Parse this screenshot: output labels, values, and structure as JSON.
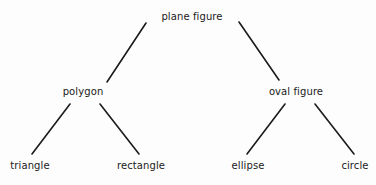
{
  "diagram": {
    "type": "tree",
    "colors": {
      "background": "#fdfdfd",
      "line": "#1a1a1a",
      "text": "#1a1a1a"
    },
    "nodes": {
      "root": {
        "label": "plane figure",
        "x": 192,
        "y": 17
      },
      "polygon": {
        "label": "polygon",
        "x": 83,
        "y": 92
      },
      "oval": {
        "label": "oval figure",
        "x": 296,
        "y": 92
      },
      "triangle": {
        "label": "triangle",
        "x": 30,
        "y": 166
      },
      "rectangle": {
        "label": "rectangle",
        "x": 141,
        "y": 166
      },
      "ellipse": {
        "label": "ellipse",
        "x": 248,
        "y": 166
      },
      "circle": {
        "label": "circle",
        "x": 355,
        "y": 166
      }
    },
    "edges": [
      {
        "from": "plane figure",
        "to": "polygon"
      },
      {
        "from": "plane figure",
        "to": "oval figure"
      },
      {
        "from": "polygon",
        "to": "triangle"
      },
      {
        "from": "polygon",
        "to": "rectangle"
      },
      {
        "from": "oval figure",
        "to": "ellipse"
      },
      {
        "from": "oval figure",
        "to": "circle"
      }
    ]
  }
}
